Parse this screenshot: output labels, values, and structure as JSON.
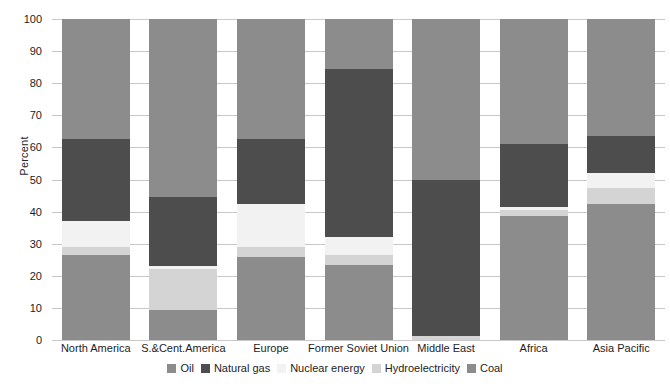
{
  "chart_data": {
    "type": "bar",
    "subtype": "stacked-percentage",
    "title": "",
    "xlabel": "",
    "ylabel": "Percent",
    "ylim": [
      0,
      100
    ],
    "yticks": [
      0,
      10,
      20,
      30,
      40,
      50,
      60,
      70,
      80,
      90,
      100
    ],
    "grid": true,
    "legend_position": "bottom",
    "categories": [
      "North America",
      "S.&Cent.America",
      "Europe",
      "Former Soviet Union",
      "Middle East",
      "Africa",
      "Asia Pacific"
    ],
    "series": [
      {
        "name": "Oil",
        "color": "#8c8c8c",
        "values": [
          37.5,
          55.5,
          37.5,
          15.5,
          50.0,
          39.0,
          36.5
        ]
      },
      {
        "name": "Natural gas",
        "color": "#4d4d4d",
        "values": [
          25.5,
          21.5,
          20.0,
          52.5,
          48.8,
          19.5,
          11.5
        ]
      },
      {
        "name": "Nuclear energy",
        "color": "#f2f2f2",
        "values": [
          8.0,
          1.0,
          13.5,
          5.5,
          0.0,
          1.0,
          4.5
        ]
      },
      {
        "name": "Hydroelectricity",
        "color": "#d4d4d4",
        "values": [
          2.5,
          12.5,
          3.0,
          3.0,
          1.2,
          2.0,
          5.0
        ]
      },
      {
        "name": "Coal",
        "color": "#8c8c8c",
        "values": [
          26.5,
          9.5,
          26.0,
          23.5,
          0.0,
          38.5,
          42.5
        ]
      }
    ],
    "stack_order_bottom_to_top": [
      "Coal",
      "Hydroelectricity",
      "Nuclear energy",
      "Natural gas",
      "Oil"
    ],
    "legend": [
      {
        "label": "Oil",
        "color": "#8c8c8c"
      },
      {
        "label": "Natural gas",
        "color": "#4d4d4d"
      },
      {
        "label": "Nuclear energy",
        "color": "#f2f2f2"
      },
      {
        "label": "Hydroelectricity",
        "color": "#d4d4d4"
      },
      {
        "label": "Coal",
        "color": "#8c8c8c"
      }
    ],
    "colors": {
      "oil": "#8c8c8c",
      "natural_gas": "#4d4d4d",
      "nuclear_energy": "#f2f2f2",
      "hydroelectricity": "#d4d4d4",
      "coal": "#8c8c8c",
      "gridline": "#c9c9c9",
      "text": "#1d1d1d",
      "background": "#ffffff"
    }
  }
}
